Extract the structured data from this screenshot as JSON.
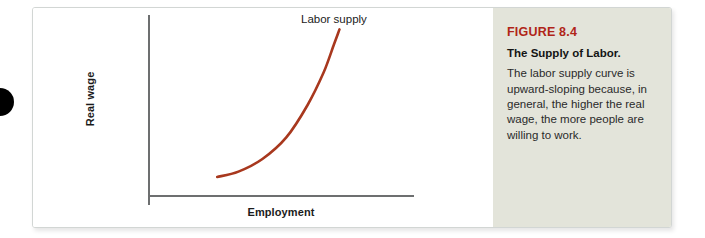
{
  "figure": {
    "number_label": "FIGURE 8.4",
    "title": "The Supply of Labor.",
    "body": "The labor supply curve is upward-sloping because, in general, the higher the real wage, the more people are willing to work.",
    "accent_color": "#b02418",
    "panel_color": "#e3e4da"
  },
  "chart_data": {
    "type": "line",
    "title": "",
    "xlabel": "Employment",
    "ylabel": "Real wage",
    "curve_label": "Labor supply",
    "curve_color": "#a8381e",
    "grid": false,
    "legend": "none",
    "axis_color": "#6d6f70",
    "xlim": [
      0,
      100
    ],
    "ylim": [
      0,
      100
    ],
    "series": [
      {
        "name": "Labor supply",
        "x": [
          26,
          34,
          43,
          52,
          60,
          66,
          70,
          72
        ],
        "y": [
          10,
          13,
          20,
          32,
          50,
          68,
          84,
          92
        ]
      }
    ]
  }
}
